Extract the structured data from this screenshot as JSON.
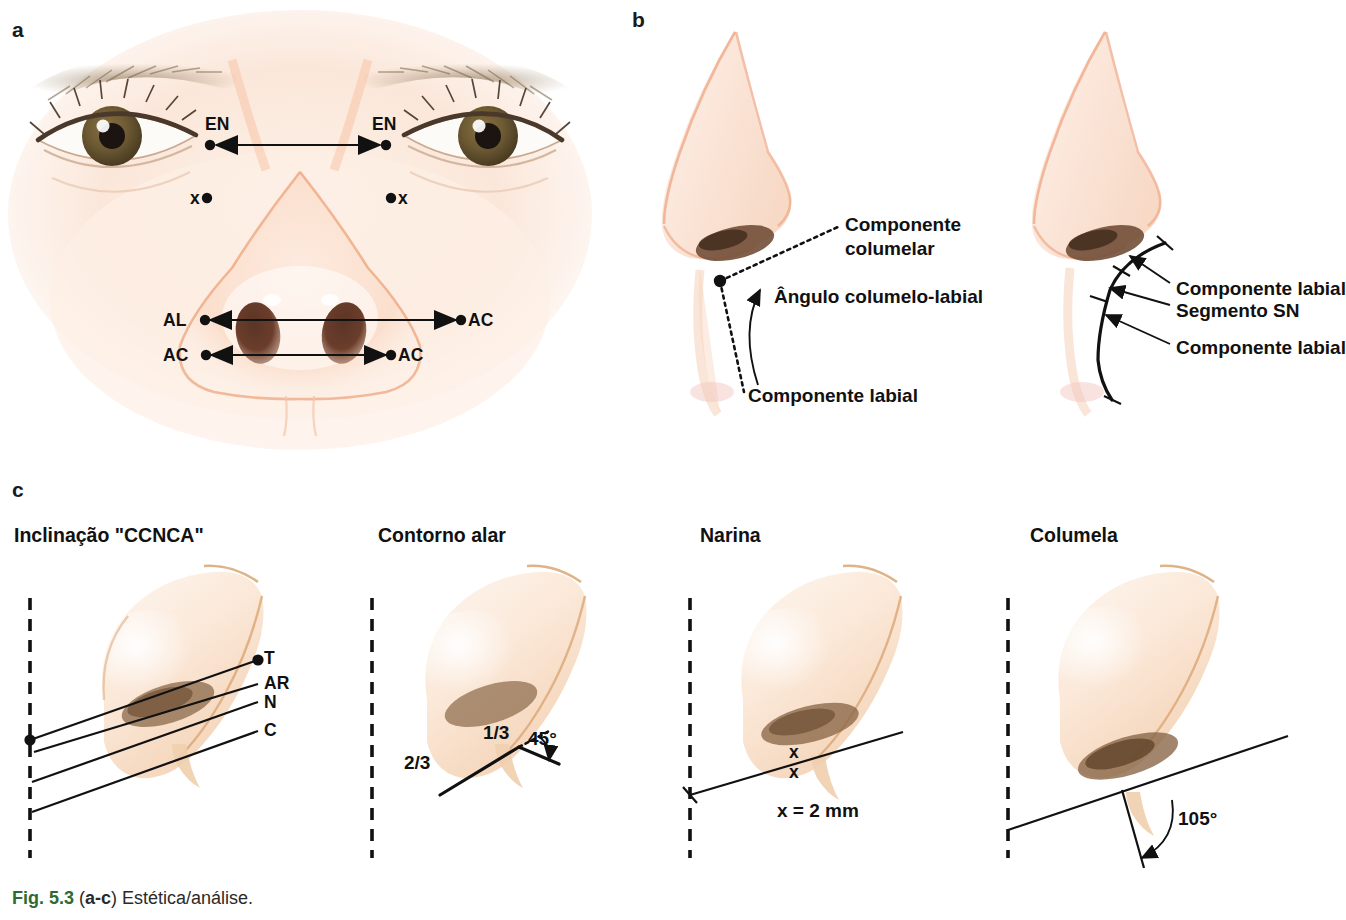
{
  "figure": {
    "panel_letters": {
      "a": "a",
      "b": "b",
      "c": "c"
    },
    "caption": {
      "fig_number": "Fig. 5.3",
      "panels_ref": "(a-c)",
      "text": " Estética/análise.",
      "open_paren": " (",
      "close_paren": ")",
      "accent_color": "#2d6b33"
    }
  },
  "panel_a": {
    "name": "frontal-face-landmarks",
    "labels": {
      "en_left": "EN",
      "en_right": "EN",
      "x_left": "x",
      "x_right": "x",
      "al_left": "AL",
      "ac_right_upper": "AC",
      "ac_left_lower": "AC",
      "ac_right_lower": "AC"
    },
    "measures": [
      {
        "id": "en-en",
        "from": "EN",
        "to": "EN"
      },
      {
        "id": "al-ac",
        "from": "AL",
        "to": "AC"
      },
      {
        "id": "ac-ac",
        "from": "AC",
        "to": "AC"
      }
    ]
  },
  "panel_b": {
    "name": "nasolabial-angle-profiles",
    "left_nose": {
      "label_columellar": "Componente",
      "label_columellar_2": "columelar",
      "label_angle": "Ângulo columelo-labial",
      "label_labial": "Componente labial"
    },
    "right_nose": {
      "label_labial_upper": "Componente labial",
      "label_segment": "Segmento SN",
      "label_labial_lower": "Componente labial"
    }
  },
  "panel_c": {
    "name": "basal-view-analyses",
    "items": [
      {
        "id": "ccnca",
        "subtitle": "Inclinação \"CCNCA\"",
        "line_labels": [
          "T",
          "AR",
          "N",
          "C"
        ]
      },
      {
        "id": "contorno-alar",
        "subtitle": "Contorno alar",
        "ratio_major": "2/3",
        "ratio_minor": "1/3",
        "angle": "45°"
      },
      {
        "id": "narina",
        "subtitle": "Narina",
        "mark_upper": "x",
        "mark_lower": "x",
        "note": "x = 2 mm"
      },
      {
        "id": "columela",
        "subtitle": "Columela",
        "angle": "105°"
      }
    ]
  }
}
